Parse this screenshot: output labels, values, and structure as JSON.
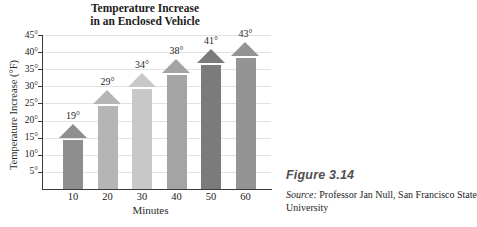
{
  "title": {
    "line1": "Temperature Increase",
    "line2": "in an Enclosed Vehicle"
  },
  "chart_data": {
    "type": "bar",
    "title": "Temperature Increase in an Enclosed Vehicle",
    "categories": [
      "10",
      "20",
      "30",
      "40",
      "50",
      "60"
    ],
    "values": [
      19,
      29,
      34,
      38,
      41,
      43
    ],
    "value_labels": [
      "19°",
      "29°",
      "34°",
      "38°",
      "41°",
      "43°"
    ],
    "xlabel": "Minutes",
    "ylabel": "Temperature Increase (°F)",
    "ylim": [
      0,
      45
    ],
    "ytick_step": 5,
    "ytick_labels": [
      "5°",
      "10°",
      "15°",
      "20°",
      "25°",
      "30°",
      "35°",
      "40°",
      "45°"
    ],
    "grid": true,
    "bar_style": "arrow-top",
    "bar_colors": [
      "#8e8e8e",
      "#b5b5b5",
      "#c8c8c8",
      "#a4a4a4",
      "#7b7b7b",
      "#949494"
    ],
    "axis_color": "#3a3a3a",
    "grid_color": "#e2e2e2"
  },
  "caption": {
    "figure_label": "Figure 3.14",
    "source_prefix": "Source:",
    "source_line1_rest": " Professor Jan Null, San Francisco State",
    "source_line2": "University"
  }
}
